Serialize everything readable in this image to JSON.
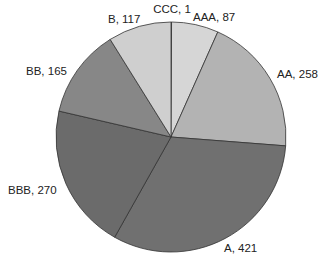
{
  "chart_data": {
    "type": "pie",
    "title": "",
    "start_angle": "12 o'clock",
    "direction": "clockwise",
    "categories": [
      "CCC",
      "AAA",
      "AA",
      "A",
      "BBB",
      "BB",
      "B"
    ],
    "values": [
      1,
      87,
      258,
      421,
      270,
      165,
      117
    ],
    "labels": [
      "CCC, 1",
      "AAA, 87",
      "AA, 258",
      "A, 421",
      "BBB, 270",
      "BB, 165",
      "B, 117"
    ],
    "colors": [
      "#dadada",
      "#d6d6d6",
      "#b3b3b3",
      "#707070",
      "#6b6b6b",
      "#878787",
      "#cfcfcf"
    ],
    "legend": "none",
    "label_format": "category, value"
  },
  "geometry": {
    "cx": 171,
    "cy": 137,
    "r": 115
  }
}
